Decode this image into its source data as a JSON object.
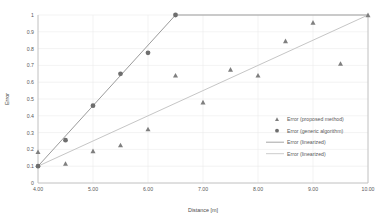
{
  "chart_data": {
    "type": "scatter",
    "title": "",
    "xlabel": "Distance [m]",
    "ylabel": "Error",
    "xlim": [
      4.0,
      10.0
    ],
    "ylim": [
      0,
      1
    ],
    "xticks": [
      "4.00",
      "5.00",
      "6.00",
      "7.00",
      "8.00",
      "9.00",
      "10.00"
    ],
    "xtick_values": [
      4.0,
      5.0,
      6.0,
      7.0,
      8.0,
      9.0,
      10.0
    ],
    "yticks": [
      "0",
      "0.1",
      "0.2",
      "0.3",
      "0.4",
      "0.5",
      "0.6",
      "0.7",
      "0.8",
      "0.9",
      "1"
    ],
    "ytick_values": [
      0,
      0.1,
      0.2,
      0.3,
      0.4,
      0.5,
      0.6,
      0.7,
      0.8,
      0.9,
      1.0
    ],
    "grid": true,
    "legend_position": "center-right",
    "series": [
      {
        "name": "Error (proposed method)",
        "marker": "triangle",
        "color": "#7f7f7f",
        "points": [
          {
            "x": 4.0,
            "y": 0.185
          },
          {
            "x": 4.5,
            "y": 0.115
          },
          {
            "x": 5.0,
            "y": 0.19
          },
          {
            "x": 5.5,
            "y": 0.225
          },
          {
            "x": 6.0,
            "y": 0.32
          },
          {
            "x": 6.5,
            "y": 0.64
          },
          {
            "x": 7.0,
            "y": 0.48
          },
          {
            "x": 7.5,
            "y": 0.675
          },
          {
            "x": 8.0,
            "y": 0.64
          },
          {
            "x": 8.5,
            "y": 0.845
          },
          {
            "x": 9.0,
            "y": 0.955
          },
          {
            "x": 9.5,
            "y": 0.71
          },
          {
            "x": 10.0,
            "y": 1.0
          }
        ]
      },
      {
        "name": "Error (generic algorithm)",
        "marker": "circle",
        "color": "#6e6e6e",
        "points": [
          {
            "x": 4.0,
            "y": 0.1
          },
          {
            "x": 4.5,
            "y": 0.255
          },
          {
            "x": 5.0,
            "y": 0.46
          },
          {
            "x": 5.5,
            "y": 0.65
          },
          {
            "x": 6.0,
            "y": 0.775
          },
          {
            "x": 6.5,
            "y": 1.0
          }
        ]
      },
      {
        "name": "Error (linearized)",
        "marker": "line",
        "color": "#9b9b9b",
        "points": [
          {
            "x": 4.0,
            "y": 0.1
          },
          {
            "x": 6.5,
            "y": 1.0
          },
          {
            "x": 10.0,
            "y": 1.0
          }
        ]
      },
      {
        "name": "Error (linearized)",
        "marker": "line",
        "color": "#c6c6c6",
        "points": [
          {
            "x": 4.0,
            "y": 0.1
          },
          {
            "x": 10.0,
            "y": 1.0
          }
        ]
      }
    ]
  },
  "legend": {
    "entries": [
      {
        "label": "Error (proposed method)",
        "marker": "triangle",
        "color": "#7f7f7f"
      },
      {
        "label": "Error (generic algorithm)",
        "marker": "circle",
        "color": "#6e6e6e"
      },
      {
        "label": "Error (linearized)",
        "marker": "line",
        "color": "#9b9b9b"
      },
      {
        "label": "Error (linearized)",
        "marker": "line",
        "color": "#c6c6c6"
      }
    ]
  },
  "colors": {
    "background": "#ffffff",
    "grid": "#ebebeb",
    "axis": "#bfbfbf",
    "text": "#5a5a5a"
  }
}
